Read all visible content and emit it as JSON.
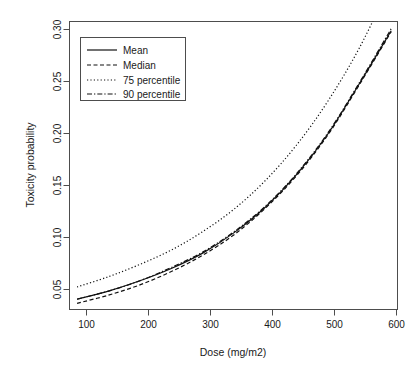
{
  "chart_data": {
    "type": "line",
    "title": "",
    "xlabel": "Dose (mg/m2)",
    "ylabel": "Toxicity probability",
    "xlim": [
      88,
      610
    ],
    "ylim": [
      0.036,
      0.317
    ],
    "xticks": [
      100,
      200,
      300,
      400,
      500,
      600
    ],
    "xtick_labels": [
      "100",
      "200",
      "300",
      "400",
      "500",
      "600"
    ],
    "yticks": [
      0.05,
      0.1,
      0.15,
      0.2,
      0.25,
      0.3
    ],
    "ytick_labels": [
      "0.05",
      "0.10",
      "0.15",
      "0.20",
      "0.25",
      "0.30"
    ],
    "grid": false,
    "legend_position": "top-left",
    "x": [
      100,
      150,
      200,
      250,
      300,
      350,
      400,
      450,
      500,
      550,
      600
    ],
    "series": [
      {
        "name": "Mean",
        "style": "solid",
        "values": [
          0.046,
          0.054,
          0.064,
          0.076,
          0.091,
          0.111,
          0.136,
          0.168,
          0.208,
          0.257,
          0.308
        ]
      },
      {
        "name": "Median",
        "style": "dashed",
        "values": [
          0.042,
          0.05,
          0.06,
          0.073,
          0.089,
          0.109,
          0.135,
          0.167,
          0.207,
          0.256,
          0.307
        ]
      },
      {
        "name": "75 percentile",
        "style": "dotted",
        "values": [
          0.058,
          0.068,
          0.08,
          0.094,
          0.112,
          0.134,
          0.162,
          0.197,
          0.24,
          0.292,
          0.355
        ]
      },
      {
        "name": "90 percentile",
        "style": "dashdot",
        "values": [
          0.046,
          0.054,
          0.064,
          0.077,
          0.092,
          0.112,
          0.137,
          0.169,
          0.209,
          0.258,
          0.31
        ]
      }
    ],
    "legend": [
      {
        "label": "Mean",
        "style": "solid"
      },
      {
        "label": "Median",
        "style": "dashed"
      },
      {
        "label": "75 percentile",
        "style": "dotted"
      },
      {
        "label": "90 percentile",
        "style": "dashdot"
      }
    ]
  },
  "colors": {
    "background": "#ffffff",
    "line": "#111111",
    "axis": "#4d4d4d",
    "text": "#1a1a1a"
  }
}
